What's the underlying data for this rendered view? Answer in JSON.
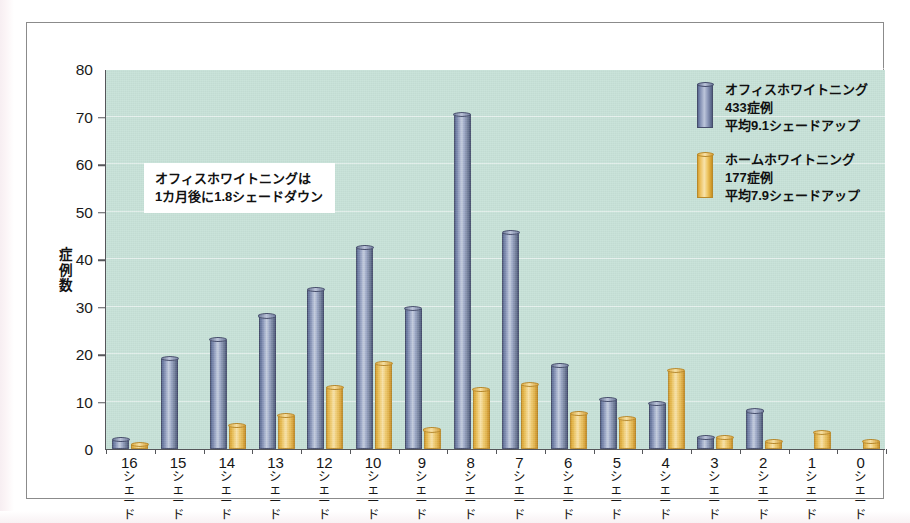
{
  "chart_data": {
    "type": "bar",
    "title": "",
    "xlabel": "",
    "ylabel": "症例数",
    "ylim": [
      0,
      80
    ],
    "ytick_values": [
      0,
      10,
      20,
      30,
      40,
      50,
      60,
      70,
      80
    ],
    "ytick_labels": [
      "0",
      "10",
      "20",
      "30",
      "40",
      "50",
      "60",
      "70",
      "80"
    ],
    "grid": true,
    "legend_position": "top-right",
    "category_unit": "シェード",
    "categories": [
      "16シェード",
      "15シェード",
      "14シェード",
      "13シェード",
      "12シェード",
      "10シェード",
      "9シェード",
      "8シェード",
      "7シェード",
      "6シェード",
      "5シェード",
      "4シェード",
      "3シェード",
      "2シェード",
      "1シェード",
      "0シェード"
    ],
    "category_numbers": [
      "16",
      "15",
      "14",
      "13",
      "12",
      "10",
      "9",
      "8",
      "7",
      "6",
      "5",
      "4",
      "3",
      "2",
      "1",
      "0"
    ],
    "series": [
      {
        "name": "オフィスホワイトニング",
        "color": "#8693b6",
        "values": [
          2,
          19,
          23,
          28,
          33.5,
          42.5,
          29.5,
          70.5,
          45.5,
          17.5,
          10.5,
          9.5,
          2.5,
          8,
          0,
          0
        ]
      },
      {
        "name": "ホームホワイトニング",
        "color": "#edc465",
        "values": [
          1,
          0,
          5,
          7,
          13,
          18,
          4,
          12.5,
          13.5,
          7.5,
          6.5,
          16.5,
          2.5,
          1.5,
          3.5,
          1.5
        ]
      }
    ]
  },
  "legend": {
    "entries": [
      {
        "swatch": "blue",
        "name": "オフィスホワイトニング",
        "cases": "433症例",
        "average": "平均9.1シェードアップ"
      },
      {
        "swatch": "yellow",
        "name": "ホームホワイトニング",
        "cases": "177症例",
        "average": "平均7.9シェードアップ"
      }
    ]
  },
  "annotation": {
    "line1": "オフィスホワイトニングは",
    "line2": "1カ月後に1.8シェードダウン"
  },
  "axis": {
    "y_title_chars": [
      "症",
      "例",
      "数"
    ]
  },
  "colors": {
    "plot_background": "#c6e1d7",
    "page_background": "#ffffff",
    "axis_line": "#55565a",
    "frame_border": "#8b8b8b",
    "series_blue": "#8693b6",
    "series_yellow": "#edc465",
    "gridline": "#ffffff"
  }
}
